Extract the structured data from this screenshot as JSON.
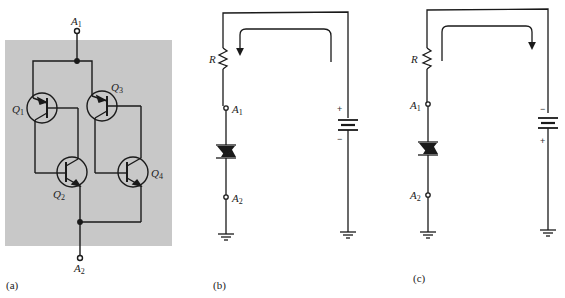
{
  "figure": {
    "panels": [
      {
        "id": "a",
        "caption": "(a)",
        "background_color": "#c8c8c8",
        "terminals": {
          "top": {
            "name": "A",
            "sub": "1"
          },
          "bottom": {
            "name": "A",
            "sub": "2"
          }
        },
        "transistors": [
          {
            "name": "Q",
            "sub": "1",
            "type": "pnp"
          },
          {
            "name": "Q",
            "sub": "2",
            "type": "npn"
          },
          {
            "name": "Q",
            "sub": "3",
            "type": "pnp"
          },
          {
            "name": "Q",
            "sub": "4",
            "type": "npn"
          }
        ]
      },
      {
        "id": "b",
        "caption": "(b)",
        "resistor_label": "R",
        "terminals": {
          "top": {
            "name": "A",
            "sub": "1"
          },
          "bottom": {
            "name": "A",
            "sub": "2"
          }
        },
        "battery": {
          "top_sign": "+",
          "bottom_sign": "−"
        },
        "current_arrow": "counter-clockwise (down at left)"
      },
      {
        "id": "c",
        "caption": "(c)",
        "resistor_label": "R",
        "terminals": {
          "top": {
            "name": "A",
            "sub": "1"
          },
          "bottom": {
            "name": "A",
            "sub": "2"
          }
        },
        "battery": {
          "top_sign": "−",
          "bottom_sign": "+"
        },
        "current_arrow": "clockwise (down at right)"
      }
    ]
  },
  "colors": {
    "ink": "#1a1a1a",
    "panel_bg": "#c8c8c8",
    "page_bg": "#ffffff"
  }
}
